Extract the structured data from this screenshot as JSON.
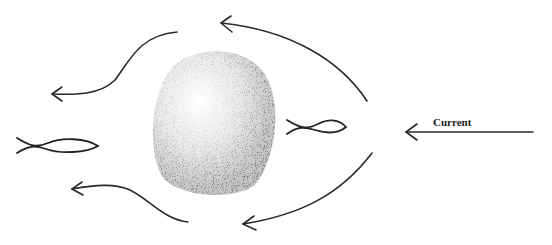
{
  "diagram": {
    "labels": {
      "current": "Current"
    },
    "elements": [
      {
        "id": "current-arrow",
        "type": "arrow",
        "direction": "left",
        "label": "Current"
      },
      {
        "id": "rock",
        "type": "stippled-blob"
      },
      {
        "id": "fish-front",
        "type": "fish",
        "position": "upstream of rock"
      },
      {
        "id": "fish-back",
        "type": "fish",
        "position": "downstream, far left"
      },
      {
        "id": "flow-upper-right",
        "type": "curved-arrow"
      },
      {
        "id": "flow-lower-right",
        "type": "curved-arrow"
      },
      {
        "id": "flow-upper-left",
        "type": "curved-arrow"
      },
      {
        "id": "flow-lower-left",
        "type": "curved-arrow"
      }
    ],
    "colors": {
      "ink": "#2a2a2a",
      "background": "#ffffff"
    }
  }
}
